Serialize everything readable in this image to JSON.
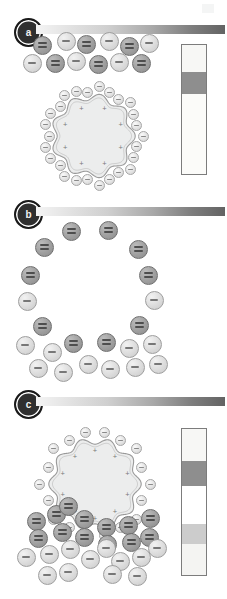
{
  "figure": {
    "background_color": "#ffffff",
    "artifact_label": ""
  },
  "panels": [
    {
      "id": "a",
      "badge_label": "a",
      "rule": {
        "name": "gradient-rule",
        "from_color": "#f4f4f4",
        "to_color": "#636363"
      },
      "vesicle": {
        "name": "cationic-vesicle",
        "fill_color": "#eceded",
        "stroke_color": "#9a9a9a",
        "charge_symbol": "+",
        "charge_count": 8
      },
      "bound_ions": {
        "name": "bound-monovalent-anions",
        "symbol": "−",
        "count": 26,
        "color": "#e3e3e3"
      },
      "free_ions": [
        {
          "type": "divalent",
          "symbol": "=",
          "count": 6,
          "color": "#9f9f9f"
        },
        {
          "type": "monovalent",
          "symbol": "−",
          "count": 6,
          "color": "#dcdcdc"
        }
      ],
      "strip": {
        "name": "colorimetric-strip",
        "border_color": "#7c7c7c",
        "segments": [
          {
            "label": "top-light",
            "color": "#f7f7f5",
            "height_pct": 21
          },
          {
            "label": "dark-band",
            "color": "#8e8e8e",
            "height_pct": 17
          },
          {
            "label": "lower-light",
            "color": "#fbfbf9",
            "height_pct": 62
          }
        ]
      }
    },
    {
      "id": "b",
      "badge_label": "b",
      "rule": {
        "name": "gradient-rule",
        "from_color": "#f4f4f4",
        "to_color": "#636363"
      },
      "vesicle": {
        "name": "cationic-vesicle",
        "fill_color": "#eceded",
        "stroke_color": "#9a9a9a",
        "charge_symbol": "+",
        "charge_count": 10
      },
      "bound_ions": {
        "name": "bound-monovalent-anions",
        "symbol": "−",
        "count": 18,
        "color": "#e3e3e3"
      },
      "free_ions": [
        {
          "type": "divalent",
          "symbol": "=",
          "count": 9,
          "color": "#9f9f9f"
        },
        {
          "type": "monovalent",
          "symbol": "−",
          "count": 14,
          "color": "#dcdcdc"
        }
      ],
      "strip": {
        "name": "colorimetric-strip",
        "border_color": "#7c7c7c",
        "segments": [
          {
            "label": "top-light",
            "color": "#f7f7f5",
            "height_pct": 22
          },
          {
            "label": "dark-band",
            "color": "#8e8e8e",
            "height_pct": 17
          },
          {
            "label": "mid-white",
            "color": "#ffffff",
            "height_pct": 26
          },
          {
            "label": "mid-gray",
            "color": "#cccccc",
            "height_pct": 14
          },
          {
            "label": "bottom-light",
            "color": "#f4f4f2",
            "height_pct": 21
          }
        ]
      }
    },
    {
      "id": "c",
      "badge_label": "c",
      "rule": {
        "name": "gradient-rule",
        "from_color": "#f4f4f4",
        "to_color": "#636363"
      },
      "vesicle": {
        "name": "cationic-vesicle",
        "fill_color": "#eceded",
        "stroke_color": "#9a9a9a",
        "charge_symbol": "+",
        "charge_count": 10
      },
      "bound_ions": {
        "name": "bound-monovalent-anions",
        "symbol": "−",
        "count": 22,
        "color": "#e3e3e3"
      },
      "free_ions": [
        {
          "type": "divalent",
          "symbol": "=",
          "count": 13,
          "color": "#9f9f9f"
        },
        {
          "type": "monovalent",
          "symbol": "−",
          "count": 14,
          "color": "#dcdcdc"
        }
      ],
      "strip": {
        "name": "colorimetric-strip",
        "border_color": "#7c7c7c",
        "segments": [
          {
            "label": "top-long-white",
            "color": "#fbfbf9",
            "height_pct": 59
          },
          {
            "label": "dark-band",
            "color": "#8e8e8e",
            "height_pct": 16
          },
          {
            "label": "white",
            "color": "#fdfdfb",
            "height_pct": 12
          },
          {
            "label": "bottom-gray",
            "color": "#d5d5d1",
            "height_pct": 13
          }
        ]
      }
    }
  ],
  "ion_layout": {
    "panel_a": {
      "free": [
        {
          "t": "di",
          "x": 42,
          "y": 45
        },
        {
          "t": "mono",
          "x": 66,
          "y": 41
        },
        {
          "t": "di",
          "x": 86,
          "y": 44
        },
        {
          "t": "mono",
          "x": 109,
          "y": 41
        },
        {
          "t": "di",
          "x": 129,
          "y": 46
        },
        {
          "t": "mono",
          "x": 149,
          "y": 43
        },
        {
          "t": "mono",
          "x": 32,
          "y": 63
        },
        {
          "t": "di",
          "x": 55,
          "y": 63
        },
        {
          "t": "mono",
          "x": 76,
          "y": 61
        },
        {
          "t": "di",
          "x": 98,
          "y": 64
        },
        {
          "t": "mono",
          "x": 119,
          "y": 62
        },
        {
          "t": "di",
          "x": 141,
          "y": 63
        }
      ]
    },
    "panel_b": {
      "free": [
        {
          "t": "di",
          "x": 71,
          "y": 231
        },
        {
          "t": "di",
          "x": 108,
          "y": 230
        },
        {
          "t": "di",
          "x": 44,
          "y": 247
        },
        {
          "t": "di",
          "x": 138,
          "y": 249
        },
        {
          "t": "di",
          "x": 30,
          "y": 275
        },
        {
          "t": "di",
          "x": 148,
          "y": 275
        },
        {
          "t": "mono",
          "x": 27,
          "y": 301
        },
        {
          "t": "mono",
          "x": 154,
          "y": 300
        },
        {
          "t": "di",
          "x": 42,
          "y": 326
        },
        {
          "t": "di",
          "x": 139,
          "y": 325
        },
        {
          "t": "mono",
          "x": 25,
          "y": 345
        },
        {
          "t": "mono",
          "x": 52,
          "y": 352
        },
        {
          "t": "di",
          "x": 73,
          "y": 343
        },
        {
          "t": "di",
          "x": 106,
          "y": 342
        },
        {
          "t": "mono",
          "x": 129,
          "y": 348
        },
        {
          "t": "mono",
          "x": 152,
          "y": 344
        },
        {
          "t": "mono",
          "x": 38,
          "y": 368
        },
        {
          "t": "mono",
          "x": 63,
          "y": 372
        },
        {
          "t": "mono",
          "x": 88,
          "y": 364
        },
        {
          "t": "mono",
          "x": 110,
          "y": 369
        },
        {
          "t": "mono",
          "x": 135,
          "y": 367
        },
        {
          "t": "mono",
          "x": 158,
          "y": 364
        }
      ]
    },
    "panel_c": {
      "free": [
        {
          "t": "di",
          "x": 36,
          "y": 521
        },
        {
          "t": "di",
          "x": 56,
          "y": 514
        },
        {
          "t": "di",
          "x": 38,
          "y": 538
        },
        {
          "t": "di",
          "x": 62,
          "y": 532
        },
        {
          "t": "di",
          "x": 84,
          "y": 519
        },
        {
          "t": "di",
          "x": 84,
          "y": 537
        },
        {
          "t": "di",
          "x": 106,
          "y": 527
        },
        {
          "t": "di",
          "x": 107,
          "y": 544
        },
        {
          "t": "di",
          "x": 128,
          "y": 525
        },
        {
          "t": "di",
          "x": 131,
          "y": 542
        },
        {
          "t": "di",
          "x": 150,
          "y": 518
        },
        {
          "t": "di",
          "x": 149,
          "y": 537
        },
        {
          "t": "di",
          "x": 68,
          "y": 506
        },
        {
          "t": "mono",
          "x": 26,
          "y": 557
        },
        {
          "t": "mono",
          "x": 49,
          "y": 554
        },
        {
          "t": "mono",
          "x": 70,
          "y": 549
        },
        {
          "t": "mono",
          "x": 90,
          "y": 559
        },
        {
          "t": "mono",
          "x": 106,
          "y": 548
        },
        {
          "t": "mono",
          "x": 120,
          "y": 561
        },
        {
          "t": "mono",
          "x": 141,
          "y": 557
        },
        {
          "t": "mono",
          "x": 157,
          "y": 548
        },
        {
          "t": "mono",
          "x": 47,
          "y": 575
        },
        {
          "t": "mono",
          "x": 68,
          "y": 572
        },
        {
          "t": "mono",
          "x": 112,
          "y": 574
        },
        {
          "t": "mono",
          "x": 137,
          "y": 576
        }
      ]
    }
  }
}
